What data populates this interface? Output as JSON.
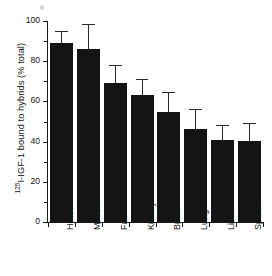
{
  "chart_data": {
    "type": "bar",
    "title": "",
    "xlabel": "",
    "ylabel_parts": {
      "superscript": "125",
      "rest": "I-IGF-1 bound to hybrids (% total)"
    },
    "ylabel": "125I-IGF-1 bound to hybrids (% total)",
    "categories": [
      "Heart",
      "Muscle",
      "Fat",
      "Kidney",
      "Brain",
      "Lung",
      "Liver",
      "Spleen"
    ],
    "values": [
      89,
      86,
      69,
      63,
      54.5,
      46.5,
      41,
      40.5
    ],
    "errors_upper": [
      5.5,
      12,
      8.5,
      7.5,
      9.5,
      9,
      7,
      8.5
    ],
    "series": [
      {
        "name": "125I-IGF-1 bound to hybrids",
        "values": [
          89,
          86,
          69,
          63,
          54.5,
          46.5,
          41,
          40.5
        ]
      }
    ],
    "ylim": [
      0,
      100
    ],
    "ytick_labels": [
      "0",
      "20",
      "40",
      "60",
      "80",
      "100"
    ],
    "ytick_values": [
      0,
      20,
      40,
      60,
      80,
      100
    ],
    "yminor_values": [
      10,
      30,
      50,
      70,
      90
    ],
    "grid": false,
    "legend": false,
    "bar_color": "#141414",
    "axis_color": "#1a1a1a",
    "error_bar_color": "#2a2a2a",
    "background": "#ffffff"
  }
}
